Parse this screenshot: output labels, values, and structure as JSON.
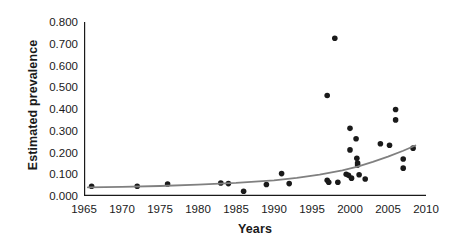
{
  "chart_data": {
    "type": "scatter",
    "title": "",
    "xlabel": "Years",
    "ylabel": "Estimated prevalence",
    "xlim": [
      1965,
      2010
    ],
    "ylim": [
      0.0,
      0.8
    ],
    "grid": false,
    "legend": null,
    "xticks": [
      "1965",
      "1970",
      "1975",
      "1980",
      "1985",
      "1990",
      "1995",
      "2000",
      "2005",
      "2010"
    ],
    "xtick_values": [
      1965,
      1970,
      1975,
      1980,
      1985,
      1990,
      1995,
      2000,
      2005,
      2010
    ],
    "yticks": [
      "0.000",
      "0.100",
      "0.200",
      "0.300",
      "0.400",
      "0.500",
      "0.600",
      "0.700",
      "0.800"
    ],
    "ytick_values": [
      0.0,
      0.1,
      0.2,
      0.3,
      0.4,
      0.5,
      0.6,
      0.7,
      0.8
    ],
    "marker": {
      "shape": "circle",
      "color": "#1a1a1a",
      "size_px": 5.6
    },
    "series": [
      {
        "name": "Estimated prevalence",
        "type": "scatter",
        "points": [
          {
            "x": 1966.0,
            "y": 0.045
          },
          {
            "x": 1972.0,
            "y": 0.045
          },
          {
            "x": 1976.0,
            "y": 0.055
          },
          {
            "x": 1983.0,
            "y": 0.06
          },
          {
            "x": 1984.0,
            "y": 0.057
          },
          {
            "x": 1986.0,
            "y": 0.022
          },
          {
            "x": 1989.0,
            "y": 0.053
          },
          {
            "x": 1991.0,
            "y": 0.103
          },
          {
            "x": 1992.0,
            "y": 0.057
          },
          {
            "x": 1997.0,
            "y": 0.462
          },
          {
            "x": 1997.0,
            "y": 0.072
          },
          {
            "x": 1997.2,
            "y": 0.063
          },
          {
            "x": 1998.0,
            "y": 0.725
          },
          {
            "x": 1998.4,
            "y": 0.063
          },
          {
            "x": 1999.5,
            "y": 0.1
          },
          {
            "x": 1999.8,
            "y": 0.095
          },
          {
            "x": 2000.0,
            "y": 0.311
          },
          {
            "x": 2000.0,
            "y": 0.212
          },
          {
            "x": 2000.2,
            "y": 0.082
          },
          {
            "x": 2000.8,
            "y": 0.263
          },
          {
            "x": 2000.9,
            "y": 0.173
          },
          {
            "x": 2001.0,
            "y": 0.152
          },
          {
            "x": 2001.0,
            "y": 0.142
          },
          {
            "x": 2001.2,
            "y": 0.098
          },
          {
            "x": 2002.0,
            "y": 0.078
          },
          {
            "x": 2004.0,
            "y": 0.24
          },
          {
            "x": 2005.2,
            "y": 0.233
          },
          {
            "x": 2006.0,
            "y": 0.398
          },
          {
            "x": 2006.0,
            "y": 0.35
          },
          {
            "x": 2007.0,
            "y": 0.17
          },
          {
            "x": 2007.0,
            "y": 0.128
          },
          {
            "x": 2008.3,
            "y": 0.22
          }
        ]
      },
      {
        "name": "Exponential trend",
        "type": "line",
        "color": "#808080",
        "linewidth_px": 1.8,
        "points": [
          {
            "x": 1965.5,
            "y": 0.04
          },
          {
            "x": 1970.0,
            "y": 0.042
          },
          {
            "x": 1975.0,
            "y": 0.046
          },
          {
            "x": 1980.0,
            "y": 0.052
          },
          {
            "x": 1985.0,
            "y": 0.06
          },
          {
            "x": 1990.0,
            "y": 0.072
          },
          {
            "x": 1993.0,
            "y": 0.083
          },
          {
            "x": 1996.0,
            "y": 0.098
          },
          {
            "x": 1999.0,
            "y": 0.118
          },
          {
            "x": 2001.0,
            "y": 0.135
          },
          {
            "x": 2003.0,
            "y": 0.157
          },
          {
            "x": 2005.0,
            "y": 0.181
          },
          {
            "x": 2007.0,
            "y": 0.208
          },
          {
            "x": 2008.6,
            "y": 0.232
          }
        ]
      }
    ]
  },
  "axes": {
    "spine_color": "#1a1a1a",
    "tick_color": "#1a1a1a"
  }
}
